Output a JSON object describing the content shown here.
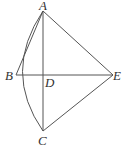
{
  "diagram": {
    "type": "geometry",
    "stroke_color": "#555555",
    "points": {
      "A": {
        "label": "A",
        "x": 43,
        "y": 11
      },
      "B": {
        "label": "B",
        "x": 16,
        "y": 75
      },
      "C": {
        "label": "C",
        "x": 43,
        "y": 131
      },
      "D": {
        "label": "D",
        "x": 43,
        "y": 75
      },
      "E": {
        "label": "E",
        "x": 113,
        "y": 75
      }
    },
    "segments": [
      "AB",
      "AC",
      "AE",
      "BE",
      "CE"
    ],
    "arcs": [
      "A-B-C"
    ]
  }
}
